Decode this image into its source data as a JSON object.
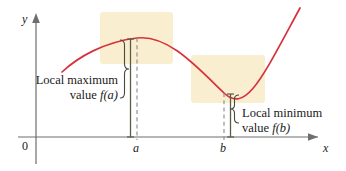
{
  "figure": {
    "background_color": "#ffffff",
    "width": 346,
    "height": 171
  },
  "axes": {
    "x_label": "x",
    "y_label": "y",
    "origin_label": "0",
    "axis_color": "#6e6e6e",
    "x_ticks": [
      {
        "label": "a",
        "x": 137
      },
      {
        "label": "b",
        "x": 224
      }
    ]
  },
  "curve": {
    "color": "#d6323c",
    "description": "cubic-like curve with a local maximum at a and a local minimum at b"
  },
  "highlight_boxes": [
    {
      "name": "local-maximum-region",
      "fill": "#faeed0",
      "x": 100,
      "y": 12,
      "width": 73,
      "height": 52
    },
    {
      "name": "local-minimum-region",
      "fill": "#faeed0",
      "x": 191,
      "y": 55,
      "width": 74,
      "height": 48
    }
  ],
  "annotations": {
    "local_maximum": {
      "line1": "Local maximum",
      "line2_prefix": "value ",
      "line2_fn": "f(a)",
      "brace": "}"
    },
    "local_minimum": {
      "line1": "Local minimum",
      "line2_prefix": "value ",
      "line2_fn": "f(b)",
      "brace": "}"
    }
  },
  "measure_lines": {
    "color": "#5c5c45",
    "dash_color": "#808080"
  },
  "chart_data": {
    "type": "line",
    "xlabel": "x",
    "ylabel": "y",
    "grid": false,
    "legend": null,
    "annotations": [
      "Local maximum value f(a)",
      "Local minimum value f(b)"
    ],
    "tick_labels_x": [
      "0",
      "a",
      "b"
    ],
    "tick_labels_y": [],
    "series": [
      {
        "name": "f(x)",
        "color": "#d6323c",
        "points_px": [
          [
            62,
            72
          ],
          [
            75,
            60
          ],
          [
            90,
            51
          ],
          [
            105,
            45
          ],
          [
            120,
            40
          ],
          [
            130,
            38.5
          ],
          [
            137,
            38
          ],
          [
            146,
            39
          ],
          [
            158,
            43
          ],
          [
            170,
            50
          ],
          [
            182,
            60
          ],
          [
            195,
            72
          ],
          [
            208,
            84
          ],
          [
            218,
            91
          ],
          [
            224,
            93
          ],
          [
            232,
            91
          ],
          [
            243,
            84
          ],
          [
            255,
            72
          ],
          [
            268,
            56
          ],
          [
            280,
            38
          ],
          [
            292,
            20
          ],
          [
            300,
            8
          ]
        ]
      }
    ]
  }
}
